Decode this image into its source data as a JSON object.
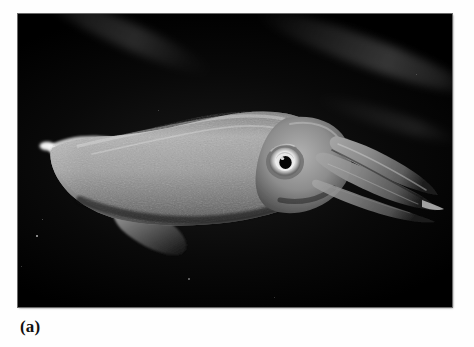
{
  "page": {
    "width": 474,
    "height": 347,
    "background_color": "#ffffff"
  },
  "figure": {
    "caption_label": "(a)",
    "photo": {
      "alt_text": "Underwater photograph of a squid against a black background",
      "frame": {
        "x": 18,
        "y": 14,
        "width": 434,
        "height": 293
      },
      "background_color": "#000000",
      "border_color": "#6a6a6a",
      "subject": {
        "name": "squid",
        "orientation": "tail-left, head-and-arms-right",
        "body_tone": "#9a9a9a",
        "highlight_tone": "#f2f2f2",
        "shadow_tone": "#1a1a1a",
        "parts": [
          {
            "part": "fin",
            "position": "left"
          },
          {
            "part": "mantle",
            "position": "center-left"
          },
          {
            "part": "head",
            "position": "center-right"
          },
          {
            "part": "eye",
            "position": "center-right"
          },
          {
            "part": "arms",
            "position": "right"
          },
          {
            "part": "tentacle-tip",
            "position": "far-right"
          }
        ]
      },
      "background_features": [
        {
          "feature": "light-streak",
          "position": "upper-left"
        },
        {
          "feature": "light-streak",
          "position": "upper-right"
        },
        {
          "feature": "light-streak",
          "position": "right"
        },
        {
          "feature": "particulate-specks",
          "position": "lower-area"
        }
      ]
    }
  }
}
